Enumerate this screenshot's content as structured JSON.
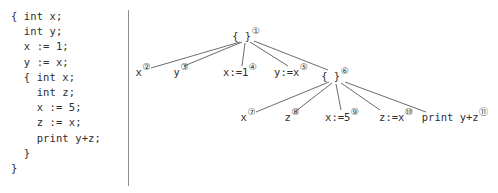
{
  "code_panel": {
    "name": "source-code-listing",
    "lines": [
      "{ int x;",
      "  int y;",
      "  x := 1;",
      "  y := x;",
      "  { int x;",
      "    int z;",
      "    x := 5;",
      "    z := x;",
      "    print y+z;",
      "  }",
      "}"
    ]
  },
  "divider": {
    "color": "#8d8d8d"
  },
  "tree": {
    "edge_color": "#5a5a5a",
    "nodes": [
      {
        "id": "n1",
        "label": "{ }",
        "tag": "①",
        "x": 118,
        "y": 36,
        "align": "center"
      },
      {
        "id": "n2",
        "label": "x",
        "tag": "②",
        "x": 15,
        "y": 72,
        "align": "center"
      },
      {
        "id": "n3",
        "label": "y",
        "tag": "③",
        "x": 53,
        "y": 72,
        "align": "center"
      },
      {
        "id": "n4",
        "label": "x:=1",
        "tag": "④",
        "x": 112,
        "y": 72,
        "align": "center"
      },
      {
        "id": "n5",
        "label": "y:=x",
        "tag": "⑤",
        "x": 163,
        "y": 72,
        "align": "center"
      },
      {
        "id": "n6",
        "label": "{ }",
        "tag": "⑥",
        "x": 207,
        "y": 76,
        "align": "center"
      },
      {
        "id": "n7",
        "label": "x",
        "tag": "⑦",
        "x": 120,
        "y": 117,
        "align": "center"
      },
      {
        "id": "n8",
        "label": "z",
        "tag": "⑧",
        "x": 164,
        "y": 117,
        "align": "center"
      },
      {
        "id": "n9",
        "label": "x:=5",
        "tag": "⑨",
        "x": 214,
        "y": 117,
        "align": "center"
      },
      {
        "id": "n10",
        "label": "z:=x",
        "tag": "⑩",
        "x": 268,
        "y": 117,
        "align": "center"
      },
      {
        "id": "n11",
        "label": "print y+z",
        "tag": "⑪",
        "x": 327,
        "y": 117,
        "align": "center"
      }
    ],
    "edges": [
      {
        "from": "n1",
        "to": "n2",
        "x1": 112,
        "y1": 42,
        "x2": 23,
        "y2": 68
      },
      {
        "from": "n1",
        "to": "n3",
        "x1": 114,
        "y1": 42,
        "x2": 56,
        "y2": 66
      },
      {
        "from": "n1",
        "to": "n4",
        "x1": 117,
        "y1": 43,
        "x2": 114,
        "y2": 66
      },
      {
        "from": "n1",
        "to": "n5",
        "x1": 122,
        "y1": 42,
        "x2": 160,
        "y2": 66
      },
      {
        "from": "n1",
        "to": "n6",
        "x1": 126,
        "y1": 41,
        "x2": 200,
        "y2": 70
      },
      {
        "from": "n6",
        "to": "n7",
        "x1": 201,
        "y1": 82,
        "x2": 128,
        "y2": 112
      },
      {
        "from": "n6",
        "to": "n8",
        "x1": 204,
        "y1": 83,
        "x2": 168,
        "y2": 111
      },
      {
        "from": "n6",
        "to": "n9",
        "x1": 208,
        "y1": 84,
        "x2": 213,
        "y2": 110
      },
      {
        "from": "n6",
        "to": "n10",
        "x1": 213,
        "y1": 83,
        "x2": 252,
        "y2": 110
      },
      {
        "from": "n6",
        "to": "n11",
        "x1": 217,
        "y1": 82,
        "x2": 298,
        "y2": 112
      }
    ]
  }
}
